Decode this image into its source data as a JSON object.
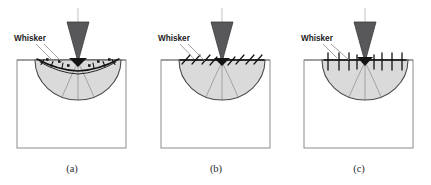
{
  "figure": {
    "title": "",
    "background_color": "#ffffff",
    "panel_count": 3
  },
  "colors": {
    "indenter_fill": "#58585a",
    "indenter_stroke": "#3b3b3d",
    "plastic_zone_fill": "#dadada",
    "plastic_zone_stroke": "#4a4a4a",
    "specimen_box_stroke": "#8c8c8c",
    "surface_line": "#7a7a7a",
    "whisker_stroke": "#111111",
    "centerline": "#b8b8b8",
    "leader_line": "#8a8a8a",
    "label_text": "#1a1a1a",
    "caption_text": "#2b2b2b"
  },
  "panels": [
    {
      "id": "a",
      "caption": "(a)",
      "whisker_label": "Whisker",
      "whisker_orientation": "tangential-curved",
      "whisker_count": 8,
      "node_marker_count": 6
    },
    {
      "id": "b",
      "caption": "(b)",
      "whisker_label": "Whisker",
      "whisker_orientation": "inclined",
      "whisker_count": 8,
      "node_marker_count": 0
    },
    {
      "id": "c",
      "caption": "(c)",
      "whisker_label": "Whisker",
      "whisker_orientation": "vertical",
      "whisker_count": 8,
      "node_marker_count": 0
    }
  ],
  "geometry": {
    "box_left": 17,
    "box_top": 60,
    "box_right": 126,
    "box_bottom": 148,
    "surface_y": 60,
    "zone_center_x": 78,
    "zone_radius_x": 43,
    "zone_radius_y": 40,
    "indenter_top_y": 22,
    "indenter_tip_y": 62,
    "indenter_half_width": 11,
    "centerline_top": 8,
    "centerline_bottom": 128
  }
}
